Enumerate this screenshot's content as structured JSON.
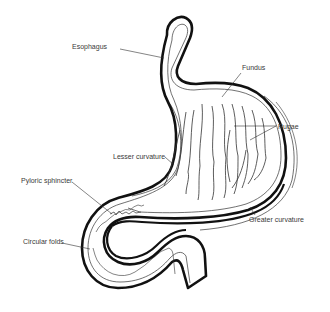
{
  "diagram": {
    "title": "",
    "colors": {
      "background": "#ffffff",
      "outline": "#111111",
      "detail": "#333333",
      "label_text": "#3a3a3a"
    },
    "labels": {
      "esophagus": "Esophagus",
      "fundus": "Fundus",
      "rugae": "Rugae",
      "lesser_curvature": "Lesser curvature",
      "pyloric_sphincter": "Pyloric sphincter",
      "greater_curvature": "Greater curvature",
      "circular_folds": "Circular folds"
    }
  }
}
